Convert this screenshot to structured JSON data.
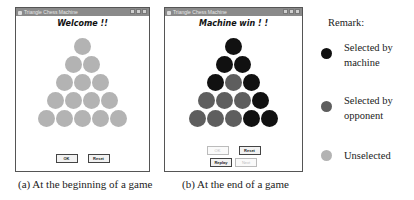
{
  "windows": [
    {
      "title": "Triangle Chess Machine",
      "heading": "Welcome !!",
      "rows": [
        [
          "u"
        ],
        [
          "u",
          "u"
        ],
        [
          "u",
          "u",
          "u"
        ],
        [
          "u",
          "u",
          "u",
          "u"
        ],
        [
          "u",
          "u",
          "u",
          "u",
          "u"
        ]
      ],
      "buttons_row1": [
        {
          "label": "OK",
          "state": "normal"
        },
        {
          "label": "Reset",
          "state": "normal"
        }
      ],
      "caption": "(a) At the beginning of a game"
    },
    {
      "title": "Triangle Chess Machine",
      "heading": "Machine win ! !",
      "rows": [
        [
          "m"
        ],
        [
          "m",
          "m"
        ],
        [
          "m",
          "o",
          "m"
        ],
        [
          "o",
          "o",
          "o",
          "m"
        ],
        [
          "o",
          "o",
          "o",
          "m",
          "m"
        ]
      ],
      "buttons_row1": [
        {
          "label": "OK",
          "state": "disabled"
        },
        {
          "label": "Reset",
          "state": "normal"
        }
      ],
      "buttons_row2": [
        {
          "label": "Replay",
          "state": "normal"
        },
        {
          "label": "Next",
          "state": "disabled"
        }
      ],
      "caption": "(b) At the end of a game"
    }
  ],
  "legend": {
    "title": "Remark:",
    "items": [
      {
        "label_line1": "Selected by",
        "label_line2": "machine",
        "color": "#111111"
      },
      {
        "label_line1": "Selected by",
        "label_line2": "opponent",
        "color": "#5e5e5e"
      },
      {
        "label_line1": "Unselected",
        "label_line2": "",
        "color": "#b3b3b3"
      }
    ]
  },
  "colors": {
    "machine": "#111111",
    "opponent": "#5e5e5e",
    "unselected": "#b3b3b3"
  }
}
